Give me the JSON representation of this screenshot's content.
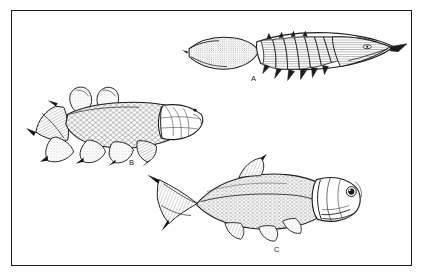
{
  "figure": {
    "background_color": "#ffffff",
    "frame_color": "#1c1c1c",
    "ink_color": "#1a1a1a",
    "medium": "pen-and-ink line drawing",
    "panels": [
      {
        "label": "A",
        "name": "armored-fish",
        "description": "Elongate armored jawless/placoderm-like fish with segmented dorsal trunk plates, ventral spines and stippled tapering body",
        "orientation": "head to the right",
        "label_x": 239,
        "label_y": 64
      },
      {
        "label": "B",
        "name": "lobe-finned-fish",
        "description": "Lobe-finned (crossopterygian) fish with fleshy paired fins, diamond scale pattern and plated head",
        "orientation": "head to the right",
        "label_x": 117,
        "label_y": 148
      },
      {
        "label": "C",
        "name": "ray-finned-fish",
        "description": "Ray-finned teleost fish with deeply forked caudal fin, large eye, upturned jaw and large operculum",
        "orientation": "head to the right",
        "label_x": 262,
        "label_y": 235
      }
    ]
  }
}
